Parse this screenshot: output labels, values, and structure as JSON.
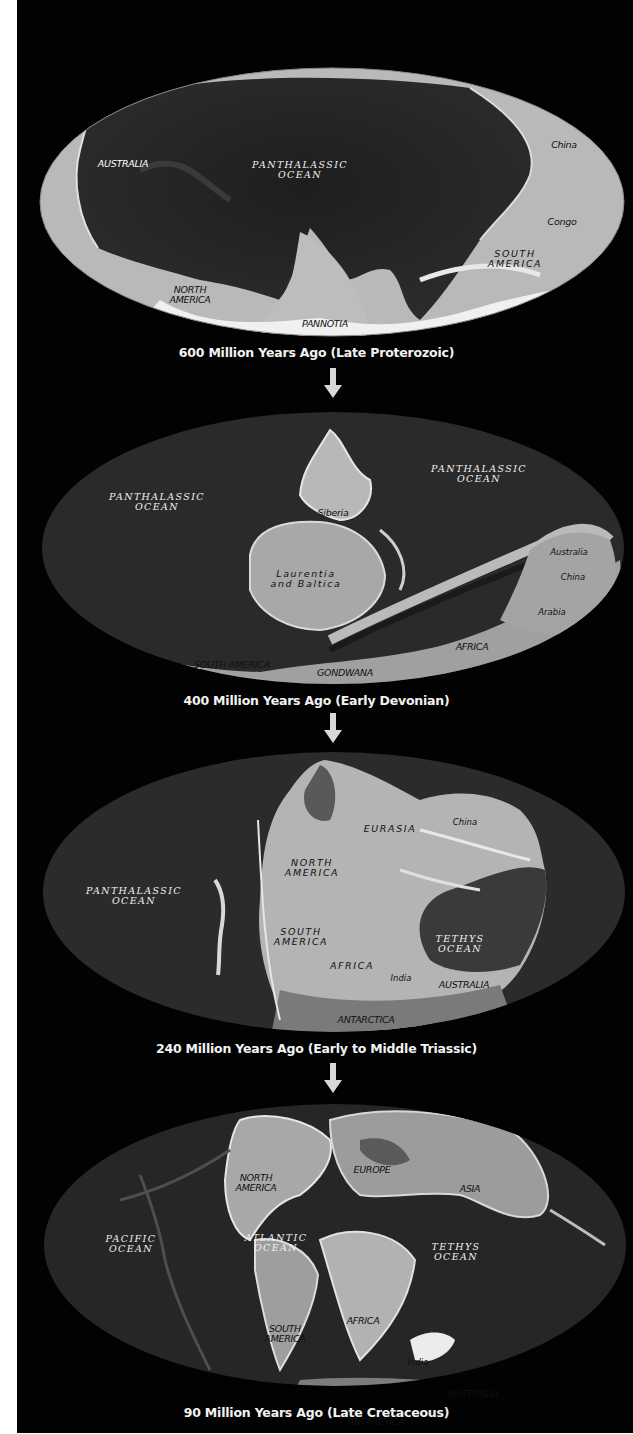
{
  "figure": {
    "stages": [
      {
        "caption": "600 Million Years Ago (Late Proterozoic)",
        "labels": {
          "ocean": "PANTHALASSIC OCEAN",
          "ocean_l1": "PANTHALASSIC",
          "ocean_l2": "OCEAN",
          "australia": "AUSTRALIA",
          "north_america_l1": "NORTH",
          "north_america_l2": "AMERICA",
          "pannotia": "PANNOTIA",
          "south_america_l1": "SOUTH",
          "south_america_l2": "AMERICA",
          "china": "China",
          "congo": "Congo"
        }
      },
      {
        "caption": "400 Million Years Ago (Early Devonian)",
        "labels": {
          "ocean_west_l1": "PANTHALASSIC",
          "ocean_west_l2": "OCEAN",
          "ocean_east_l1": "PANTHALASSIC",
          "ocean_east_l2": "OCEAN",
          "siberia": "Siberia",
          "laurentia_l1": "Laurentia",
          "laurentia_l2": "and Baltica",
          "australia": "Australia",
          "china": "China",
          "arabia": "Arabia",
          "africa": "AFRICA",
          "south_america": "SOUTH AMERICA",
          "gondwana": "GONDWANA"
        }
      },
      {
        "caption": "240 Million Years Ago (Early to Middle Triassic)",
        "labels": {
          "ocean_l1": "PANTHALASSIC",
          "ocean_l2": "OCEAN",
          "eurasia": "EURASIA",
          "china": "China",
          "north_america_l1": "NORTH",
          "north_america_l2": "AMERICA",
          "south_america_l1": "SOUTH",
          "south_america_l2": "AMERICA",
          "africa": "AFRICA",
          "india": "India",
          "tethys_l1": "TETHYS",
          "tethys_l2": "OCEAN",
          "australia": "AUSTRALIA",
          "antarctica": "ANTARCTICA"
        }
      },
      {
        "caption": "90 Million Years Ago (Late Cretaceous)",
        "labels": {
          "pacific_l1": "PACIFIC",
          "pacific_l2": "OCEAN",
          "north_america_l1": "NORTH",
          "north_america_l2": "AMERICA",
          "europe": "EUROPE",
          "asia": "ASIA",
          "atlantic_l1": "ATLANTIC",
          "atlantic_l2": "OCEAN",
          "south_america_l1": "SOUTH",
          "south_america_l2": "AMERICA",
          "africa": "AFRICA",
          "tethys_l1": "TETHYS",
          "tethys_l2": "OCEAN",
          "india": "India",
          "australia": "AUSTRALIA",
          "antarctica": "ANTARCTICA"
        }
      }
    ],
    "arrow_icon": "down-arrow-icon"
  },
  "colors": {
    "background": "#020202",
    "margin": "#ffffff",
    "land_light": "#c8c8c8",
    "land_mid": "#9a9a9a",
    "ocean_dark": "#262626",
    "ice_white": "#f4f4f4",
    "arrow": "#d8d8d8",
    "caption_text": "#f2f2f2"
  }
}
